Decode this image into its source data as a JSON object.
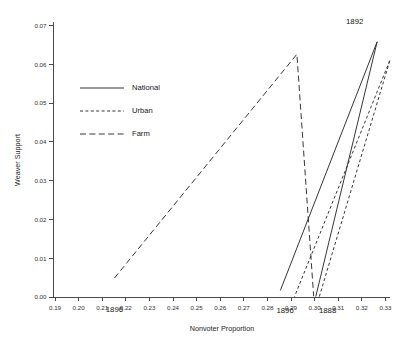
{
  "chart_data": {
    "type": "line",
    "title": "",
    "xlabel": "Nonvoter Proportion",
    "ylabel": "Weaver Support",
    "xlim": [
      0.19,
      0.33
    ],
    "ylim": [
      0.0,
      0.07
    ],
    "xticks": [
      "0.19",
      "0.20",
      "0.21",
      "0.22",
      "0.23",
      "0.24",
      "0.25",
      "0.26",
      "0.27",
      "0.28",
      "0.29",
      "0.30",
      "0.31",
      "0.32",
      "0.33"
    ],
    "xtick_values": [
      0.19,
      0.2,
      0.21,
      0.22,
      0.23,
      0.24,
      0.25,
      0.26,
      0.27,
      0.28,
      0.29,
      0.3,
      0.31,
      0.32,
      0.33
    ],
    "yticks": [
      "0.00",
      "0.01",
      "0.02",
      "0.03",
      "0.04",
      "0.05",
      "0.06",
      "0.07"
    ],
    "ytick_values": [
      0.0,
      0.01,
      0.02,
      0.03,
      0.04,
      0.05,
      0.06,
      0.07
    ],
    "grid": false,
    "legend_position": "upper left inside",
    "series": [
      {
        "name": "National",
        "style": "solid",
        "dash": "none",
        "color": "#2b2b2b",
        "points": [
          {
            "year": "1888",
            "x": 0.3005,
            "y": 0.0001
          },
          {
            "year": "1892",
            "x": 0.3265,
            "y": 0.0658
          },
          {
            "year": "1896",
            "x": 0.2855,
            "y": 0.0017
          }
        ]
      },
      {
        "name": "Urban",
        "style": "short-dashed",
        "dash": "3,2.4",
        "color": "#2b2b2b",
        "points": [
          {
            "year": "1888",
            "x": 0.302,
            "y": 0.0001
          },
          {
            "year": "1892",
            "x": 0.332,
            "y": 0.0612
          },
          {
            "year": "1896",
            "x": 0.2915,
            "y": 0.0001
          }
        ]
      },
      {
        "name": "Farm",
        "style": "long-dashed",
        "dash": "6,3.4",
        "color": "#2b2b2b",
        "points": [
          {
            "year": "1888",
            "x": 0.2152,
            "y": 0.0049
          },
          {
            "year": "1892",
            "x": 0.2925,
            "y": 0.0626
          },
          {
            "year": "1896",
            "x": 0.2996,
            "y": 0.0002
          }
        ]
      }
    ],
    "annotations": [
      {
        "text": "1892",
        "x": 0.317,
        "y": 0.0705,
        "anchor": "middle"
      },
      {
        "text": "1896",
        "x": 0.2152,
        "y": -0.0038,
        "anchor": "middle"
      },
      {
        "text": "1896",
        "x": 0.2875,
        "y": -0.0042,
        "anchor": "middle"
      },
      {
        "text": "1888",
        "x": 0.3055,
        "y": -0.0042,
        "anchor": "middle"
      }
    ]
  },
  "legend": {
    "entries": [
      {
        "label": "National"
      },
      {
        "label": "Urban"
      },
      {
        "label": "Farm"
      }
    ]
  }
}
